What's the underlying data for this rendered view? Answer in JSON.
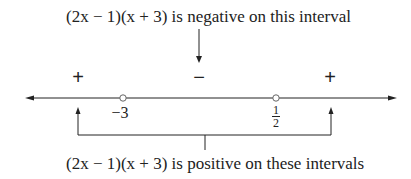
{
  "annotations": {
    "top": "(2x − 1)(x + 3) is negative on this interval",
    "bottom": "(2x − 1)(x + 3) is positive on these intervals"
  },
  "signs": [
    {
      "symbol": "+",
      "interval": "x < −3"
    },
    {
      "symbol": "−",
      "interval": "−3 < x < 1/2"
    },
    {
      "symbol": "+",
      "interval": "x > 1/2"
    }
  ],
  "number_line": {
    "critical_points": [
      {
        "label": "−3",
        "value": -3,
        "marker": "open-circle"
      },
      {
        "label_num": "1",
        "label_den": "2",
        "value": 0.5,
        "marker": "open-circle"
      }
    ]
  }
}
